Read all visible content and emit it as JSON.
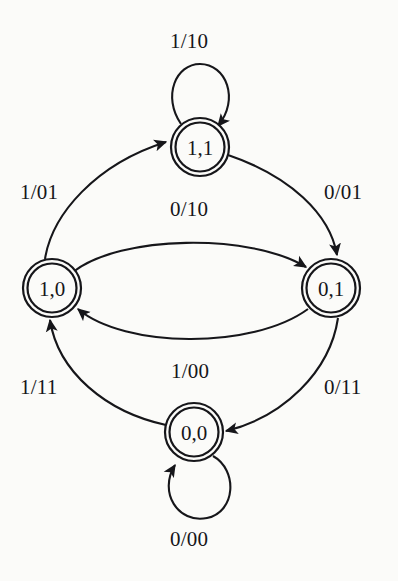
{
  "diagram": {
    "type": "mealy-state-transition-diagram",
    "title": "",
    "ink_color": "#16161a",
    "background_color": "#fbfbf9",
    "canvas": {
      "width": 398,
      "height": 581
    },
    "node_style": "double-circle",
    "states": [
      {
        "id": "s11",
        "label": "1,1",
        "cx": 200,
        "cy": 147,
        "r_outer": 29,
        "r_inner": 25
      },
      {
        "id": "s10",
        "label": "1,0",
        "cx": 52,
        "cy": 288,
        "r_outer": 29,
        "r_inner": 25
      },
      {
        "id": "s01",
        "label": "0,1",
        "cx": 331,
        "cy": 288,
        "r_outer": 29,
        "r_inner": 25
      },
      {
        "id": "s00",
        "label": "0,0",
        "cx": 194,
        "cy": 432,
        "r_outer": 29,
        "r_inner": 25
      }
    ],
    "transitions": [
      {
        "id": "t-11-11",
        "from": "s11",
        "to": "s11",
        "label": "1/10",
        "kind": "self-loop-top",
        "label_x": 170,
        "label_y": 31
      },
      {
        "id": "t-10-11",
        "from": "s10",
        "to": "s11",
        "label": "1/01",
        "kind": "arc",
        "label_x": 20,
        "label_y": 182
      },
      {
        "id": "t-11-01",
        "from": "s11",
        "to": "s01",
        "label": "0/01",
        "kind": "arc",
        "label_x": 324,
        "label_y": 182
      },
      {
        "id": "t-10-01",
        "from": "s10",
        "to": "s01",
        "label": "0/10",
        "kind": "arc",
        "label_x": 170,
        "label_y": 199
      },
      {
        "id": "t-01-10",
        "from": "s01",
        "to": "s10",
        "label": "1/00",
        "kind": "arc",
        "label_x": 171,
        "label_y": 361
      },
      {
        "id": "t-00-10",
        "from": "s00",
        "to": "s10",
        "label": "1/11",
        "kind": "arc",
        "label_x": 20,
        "label_y": 377
      },
      {
        "id": "t-01-00",
        "from": "s01",
        "to": "s00",
        "label": "0/11",
        "kind": "arc",
        "label_x": 324,
        "label_y": 377
      },
      {
        "id": "t-00-00",
        "from": "s00",
        "to": "s00",
        "label": "0/00",
        "kind": "self-loop-bottom",
        "label_x": 170,
        "label_y": 529
      }
    ]
  }
}
